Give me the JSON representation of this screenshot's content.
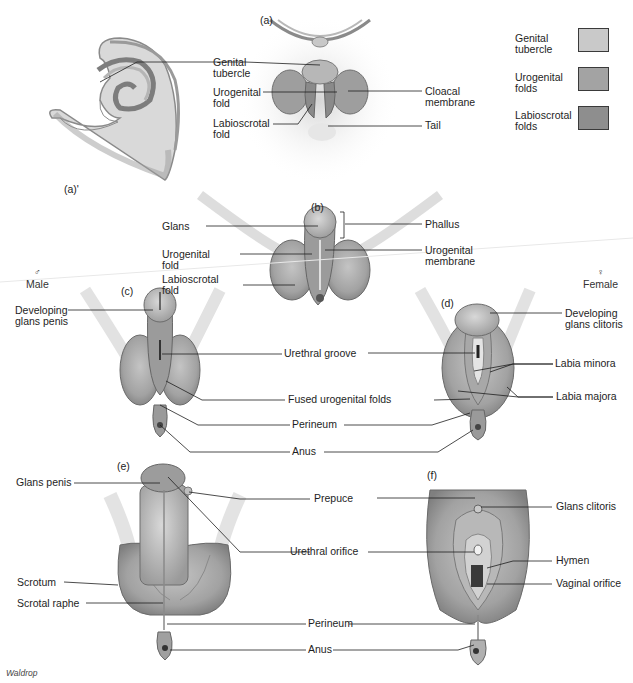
{
  "panels": {
    "a_prime": "(a)'",
    "a": "(a)",
    "b": "(b)",
    "c": "(c)",
    "d": "(d)",
    "e": "(e)",
    "f": "(f)"
  },
  "sex_labels": {
    "male": {
      "symbol": "♂",
      "label": "Male"
    },
    "female": {
      "symbol": "♀",
      "label": "Female"
    }
  },
  "legend": {
    "items": [
      {
        "label": "Genital\ntubercle",
        "color": "#c9c9c9"
      },
      {
        "label": "Urogenital\nfolds",
        "color": "#a3a3a3"
      },
      {
        "label": "Labioscrotal\nfolds",
        "color": "#8e8e8e"
      }
    ]
  },
  "labels": {
    "a": {
      "genital_tubercle": "Genital\ntubercle",
      "urogenital_fold": "Urogenital\nfold",
      "labioscrotal_fold": "Labioscrotal\nfold",
      "cloacal_membrane": "Cloacal\nmembrane",
      "tail": "Tail"
    },
    "b": {
      "glans": "Glans",
      "phallus": "Phallus",
      "urogenital_fold": "Urogenital\nfold",
      "urogenital_membrane": "Urogenital\nmembrane",
      "labioscrotal_fold": "Labioscrotal\nfold"
    },
    "cd": {
      "developing_glans_penis": "Developing\nglans penis",
      "developing_glans_clitoris": "Developing\nglans clitoris",
      "urethral_groove": "Urethral groove",
      "labia_minora": "Labia minora",
      "fused_urogenital_folds": "Fused urogenital folds",
      "labia_majora": "Labia majora",
      "perineum": "Perineum",
      "anus": "Anus"
    },
    "ef": {
      "glans_penis": "Glans penis",
      "prepuce": "Prepuce",
      "glans_clitoris": "Glans clitoris",
      "urethral_orifice": "Urethral orifice",
      "hymen": "Hymen",
      "vaginal_orifice": "Vaginal orifice",
      "scrotum": "Scrotum",
      "scrotal_raphe": "Scrotal raphe",
      "perineum": "Perineum",
      "anus": "Anus"
    }
  },
  "credit": "Waldrop"
}
